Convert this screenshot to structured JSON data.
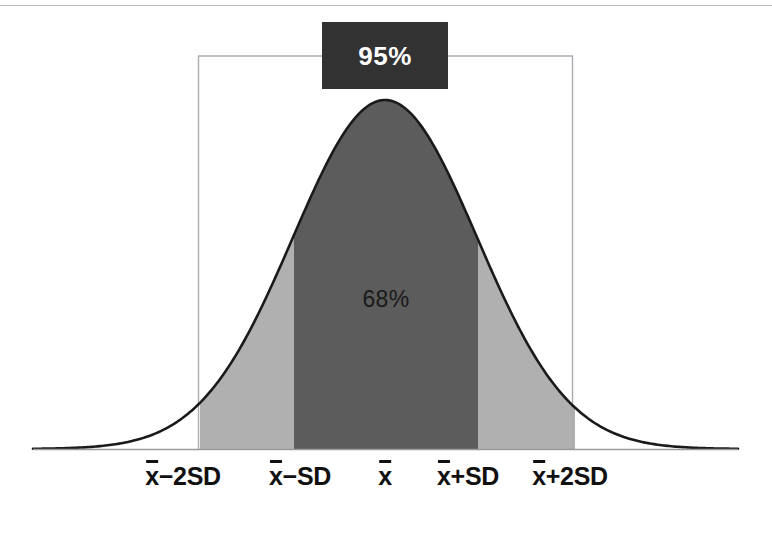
{
  "figure": {
    "name": "normal-distribution-empirical-rule",
    "background_color": "#ffffff",
    "top_rule_color": "#b9bcc0"
  },
  "annotations": {
    "ci95_label": "95%",
    "ci95_box_color": "#333233",
    "ci95_text_color": "#ffffff",
    "sd68_label": "68%",
    "sd68_text_color": "#1a1a1a"
  },
  "axis": {
    "tick_labels": [
      {
        "text_lead": "x",
        "text_rest": "−2SD",
        "full": "x̄−2SD",
        "x": 183
      },
      {
        "text_lead": "x",
        "text_rest": "−SD",
        "full": "x̄−SD",
        "x": 300
      },
      {
        "text_lead": "x",
        "text_rest": "",
        "full": "x̄",
        "x": 385
      },
      {
        "text_lead": "x",
        "text_rest": "+SD",
        "full": "x̄+SD",
        "x": 468
      },
      {
        "text_lead": "x",
        "text_rest": "+2SD",
        "full": "x̄+2SD",
        "x": 570
      }
    ],
    "baseline_color": "#9a9a9a"
  },
  "chart_data": {
    "type": "area",
    "title": "",
    "subtitle": "",
    "xlabel": "",
    "ylabel": "",
    "grid": false,
    "legend": "none",
    "distribution": "normal",
    "mean_px": 385,
    "sd_px": 92,
    "peak_y_px": 100,
    "baseline_y_px": 449,
    "x_domain_px": [
      33,
      738
    ],
    "curve_color": "#1a1a1a",
    "curve_width_px": 2.6,
    "regions": [
      {
        "name": "within-2sd",
        "label": "95%",
        "percent": 95,
        "x_from_px": 200,
        "x_to_px": 575,
        "fill": "#b0b0b0"
      },
      {
        "name": "within-1sd",
        "label": "68%",
        "percent": 68,
        "x_from_px": 294,
        "x_to_px": 478,
        "fill": "#5c5c5c"
      }
    ],
    "bracket": {
      "name": "ci95-bracket",
      "left_x_px": 198,
      "right_x_px": 573,
      "top_y_px": 56,
      "bottom_y_px": 449,
      "color": "#a9acb0"
    },
    "series": [
      {
        "name": "normal-pdf",
        "x": [
          -4,
          -3.5,
          -3,
          -2.5,
          -2,
          -1.5,
          -1,
          -0.5,
          0,
          0.5,
          1,
          1.5,
          2,
          2.5,
          3,
          3.5,
          4
        ],
        "y": [
          0.0001,
          0.0009,
          0.0044,
          0.0175,
          0.054,
          0.1295,
          0.242,
          0.3521,
          0.3989,
          0.3521,
          0.242,
          0.1295,
          0.054,
          0.0175,
          0.0044,
          0.0009,
          0.0001
        ]
      }
    ],
    "annotations": [
      {
        "text": "95%",
        "x_sd": 0,
        "at": "above-curve-bracket"
      },
      {
        "text": "68%",
        "x_sd": 0,
        "at": "inside-central-region"
      }
    ]
  }
}
